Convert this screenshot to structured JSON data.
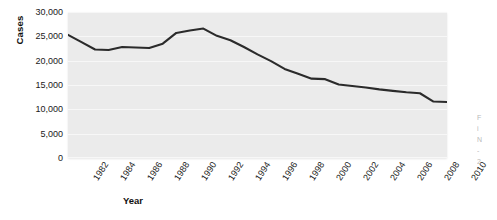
{
  "figure": {
    "background_color": "#ffffff",
    "panel_color": "#ebebeb",
    "gridline_color": "#f7f7f7",
    "line_color": "#2b2b2b"
  },
  "axes": {
    "ylabel": "Cases",
    "xlabel": "Year",
    "yticks": [
      "0",
      "5,000",
      "10,000",
      "15,000",
      "20,000",
      "25,000",
      "30,000"
    ],
    "xticks": [
      "1982",
      "1984",
      "1986",
      "1988",
      "1990",
      "1992",
      "1994",
      "1996",
      "1998",
      "2000",
      "2002",
      "2004",
      "2006",
      "2008",
      "2010"
    ]
  },
  "caption": {
    "line1": "F",
    "line2": "i",
    "line3": "N",
    "line4": "-",
    "line5": "2"
  },
  "chart_data": {
    "type": "line",
    "title": "",
    "subtitle": "",
    "xlabel": "Year",
    "ylabel": "Cases",
    "xlim": [
      1982,
      2010
    ],
    "ylim": [
      0,
      30000
    ],
    "ytick_values": [
      0,
      5000,
      10000,
      15000,
      20000,
      25000,
      30000
    ],
    "xtick_values": [
      1982,
      1984,
      1986,
      1988,
      1990,
      1992,
      1994,
      1996,
      1998,
      2000,
      2002,
      2004,
      2006,
      2008,
      2010
    ],
    "grid": "horizontal",
    "legend": "none",
    "x": [
      1982,
      1983,
      1984,
      1985,
      1986,
      1987,
      1988,
      1989,
      1990,
      1991,
      1992,
      1993,
      1994,
      1995,
      1996,
      1997,
      1998,
      1999,
      2000,
      2001,
      2002,
      2003,
      2004,
      2005,
      2006,
      2007,
      2008,
      2009,
      2010
    ],
    "values": [
      25300,
      23800,
      22300,
      22200,
      22800,
      22700,
      22600,
      23500,
      25700,
      26200,
      26600,
      25100,
      24200,
      22800,
      21300,
      19900,
      18300,
      17300,
      16300,
      16200,
      15100,
      14800,
      14500,
      14100,
      13800,
      13500,
      13300,
      11600,
      11500
    ],
    "series": [
      {
        "name": "Cases",
        "values": [
          25300,
          23800,
          22300,
          22200,
          22800,
          22700,
          22600,
          23500,
          25700,
          26200,
          26600,
          25100,
          24200,
          22800,
          21300,
          19900,
          18300,
          17300,
          16300,
          16200,
          15100,
          14800,
          14500,
          14100,
          13800,
          13500,
          13300,
          11600,
          11500
        ]
      }
    ]
  }
}
